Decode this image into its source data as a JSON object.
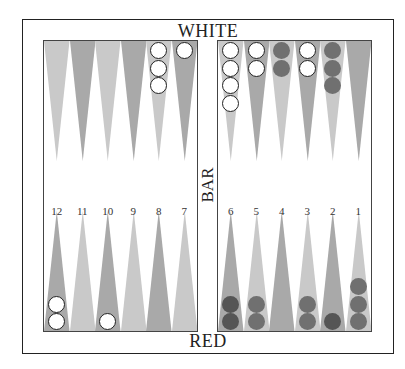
{
  "board": {
    "top_player_label": "WHITE",
    "bottom_player_label": "RED",
    "bar_label": "BAR",
    "colors": {
      "light_point": "#c9c9c9",
      "dark_point": "#a9a9a9",
      "white_checker": "#ffffff",
      "red_checker": "#707070",
      "red_checker_dark": "#555555",
      "border": "#222222"
    }
  },
  "point_numbers": {
    "left": [
      "12",
      "11",
      "10",
      "9",
      "8",
      "7"
    ],
    "right": [
      "6",
      "5",
      "4",
      "3",
      "2",
      "1"
    ]
  },
  "top_points": [
    {
      "index": 0,
      "side": "left",
      "shade": "light",
      "checkers": []
    },
    {
      "index": 1,
      "side": "left",
      "shade": "dark",
      "checkers": []
    },
    {
      "index": 2,
      "side": "left",
      "shade": "light",
      "checkers": []
    },
    {
      "index": 3,
      "side": "left",
      "shade": "dark",
      "checkers": []
    },
    {
      "index": 4,
      "side": "left",
      "shade": "light",
      "checkers": [
        "white",
        "white",
        "white"
      ]
    },
    {
      "index": 5,
      "side": "left",
      "shade": "dark",
      "checkers": [
        "white"
      ]
    },
    {
      "index": 0,
      "side": "right",
      "shade": "light",
      "checkers": [
        "white",
        "white",
        "white",
        "white"
      ]
    },
    {
      "index": 1,
      "side": "right",
      "shade": "dark",
      "checkers": [
        "white",
        "white"
      ]
    },
    {
      "index": 2,
      "side": "right",
      "shade": "light",
      "checkers": [
        "red",
        "red"
      ]
    },
    {
      "index": 3,
      "side": "right",
      "shade": "dark",
      "checkers": [
        "white",
        "white"
      ]
    },
    {
      "index": 4,
      "side": "right",
      "shade": "light",
      "checkers": [
        "red",
        "red",
        "red"
      ]
    },
    {
      "index": 5,
      "side": "right",
      "shade": "dark",
      "checkers": []
    }
  ],
  "bottom_points": [
    {
      "index": 0,
      "side": "left",
      "shade": "dark",
      "checkers": [
        "white",
        "white"
      ]
    },
    {
      "index": 1,
      "side": "left",
      "shade": "light",
      "checkers": []
    },
    {
      "index": 2,
      "side": "left",
      "shade": "dark",
      "checkers": [
        "white"
      ]
    },
    {
      "index": 3,
      "side": "left",
      "shade": "light",
      "checkers": []
    },
    {
      "index": 4,
      "side": "left",
      "shade": "dark",
      "checkers": []
    },
    {
      "index": 5,
      "side": "left",
      "shade": "light",
      "checkers": []
    },
    {
      "index": 0,
      "side": "right",
      "shade": "dark",
      "checkers": [
        "red-dark",
        "red-dark"
      ]
    },
    {
      "index": 1,
      "side": "right",
      "shade": "light",
      "checkers": [
        "red",
        "red"
      ]
    },
    {
      "index": 2,
      "side": "right",
      "shade": "dark",
      "checkers": []
    },
    {
      "index": 3,
      "side": "right",
      "shade": "light",
      "checkers": [
        "red",
        "red"
      ]
    },
    {
      "index": 4,
      "side": "right",
      "shade": "dark",
      "checkers": [
        "red-dark"
      ]
    },
    {
      "index": 5,
      "side": "right",
      "shade": "light",
      "checkers": [
        "red",
        "red",
        "red"
      ]
    }
  ]
}
